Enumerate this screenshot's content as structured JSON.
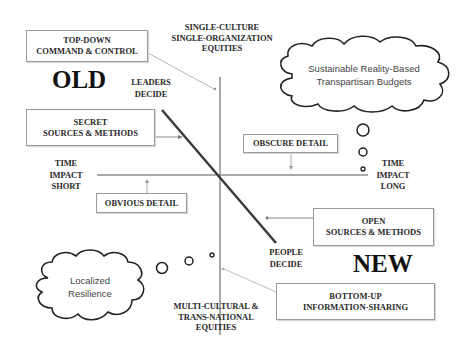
{
  "diagram": {
    "axes": {
      "vertical_top": "SINGLE-CULTURE\nSINGLE-ORGANIZATION\nEQUITIES",
      "vertical_bottom": "MULTI-CULTURAL &\nTRANS-NATIONAL\nEQUITIES",
      "horizontal_left": "TIME\nIMPACT\nSHORT",
      "horizontal_right": "TIME\nIMPACT\nLONG"
    },
    "diagonal": {
      "top_label": "LEADERS\nDECIDE",
      "bottom_label": "PEOPLE\nDECIDE"
    },
    "eras": {
      "old": "OLD",
      "new": "NEW"
    },
    "boxes": {
      "top_down": "TOP-DOWN\nCOMMAND & CONTROL",
      "secret": "SECRET\nSOURCES & METHODS",
      "obscure": "OBSCURE DETAIL",
      "obvious": "OBVIOUS DETAIL",
      "open": "OPEN\nSOURCES & METHODS",
      "bottom_up": "BOTTOM-UP\nINFORMATION-SHARING"
    },
    "clouds": {
      "top_right": "Sustainable Reality-Based\nTranspartisan Budgets",
      "bottom_left": "Localized\nResilience"
    },
    "colors": {
      "axis": "#8c8c8c",
      "diagonal": "#3a3a3a",
      "connector": "#b5b5b5",
      "box_border": "#9a9a9a",
      "text": "#2a2a2a"
    }
  }
}
